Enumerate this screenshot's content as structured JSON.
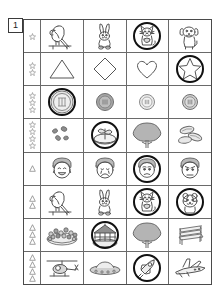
{
  "page": {
    "number_label": "1",
    "marker_star": "star",
    "marker_triangle": "triangle",
    "ring_color": "#111111",
    "grid_line_color": "#6a6a6a",
    "border_color": "#4a4a4a"
  },
  "rows": [
    {
      "marker_shape": "star",
      "marker_count": 1,
      "cells": [
        {
          "icon": "parrot-icon",
          "label": "parrot",
          "circled": false
        },
        {
          "icon": "rabbit-icon",
          "label": "rabbit",
          "circled": false
        },
        {
          "icon": "cat-icon",
          "label": "cat",
          "circled": true
        },
        {
          "icon": "dog-icon",
          "label": "dog",
          "circled": false
        }
      ]
    },
    {
      "marker_shape": "star",
      "marker_count": 2,
      "cells": [
        {
          "icon": "triangle-icon",
          "label": "triangle",
          "circled": false
        },
        {
          "icon": "diamond-icon",
          "label": "diamond",
          "circled": false
        },
        {
          "icon": "heart-icon",
          "label": "heart",
          "circled": false
        },
        {
          "icon": "star-icon",
          "label": "star",
          "circled": true
        }
      ]
    },
    {
      "marker_shape": "star",
      "marker_count": 3,
      "cells": [
        {
          "icon": "coin-large-icon",
          "label": "large coin",
          "circled": true
        },
        {
          "icon": "coin-medium-icon",
          "label": "medium coin",
          "circled": false
        },
        {
          "icon": "coin-small-icon",
          "label": "small coin",
          "circled": false
        },
        {
          "icon": "coin-small-dark-icon",
          "label": "small dark coin",
          "circled": false
        }
      ]
    },
    {
      "marker_shape": "star",
      "marker_count": 4,
      "cells": [
        {
          "icon": "seeds-icon",
          "label": "seeds",
          "circled": false
        },
        {
          "icon": "sprout-icon",
          "label": "sprout",
          "circled": true
        },
        {
          "icon": "tree-icon",
          "label": "tree",
          "circled": false
        },
        {
          "icon": "beans-icon",
          "label": "beans",
          "circled": false
        }
      ]
    },
    {
      "marker_shape": "triangle",
      "marker_count": 1,
      "cells": [
        {
          "icon": "face-happy-icon",
          "label": "happy face",
          "circled": false
        },
        {
          "icon": "face-sad-icon",
          "label": "sad face",
          "circled": false
        },
        {
          "icon": "face-worried-icon",
          "label": "worried face",
          "circled": true
        },
        {
          "icon": "face-angry-icon",
          "label": "angry face",
          "circled": false
        }
      ]
    },
    {
      "marker_shape": "triangle",
      "marker_count": 2,
      "cells": [
        {
          "icon": "parrot-icon",
          "label": "parrot",
          "circled": false
        },
        {
          "icon": "rabbit-icon",
          "label": "rabbit",
          "circled": false
        },
        {
          "icon": "cat-icon",
          "label": "cat",
          "circled": true
        },
        {
          "icon": "hamster-icon",
          "label": "hamster",
          "circled": true
        }
      ]
    },
    {
      "marker_shape": "triangle",
      "marker_count": 3,
      "cells": [
        {
          "icon": "flowerbed-icon",
          "label": "flower bed",
          "circled": false
        },
        {
          "icon": "gazebo-icon",
          "label": "gazebo",
          "circled": true
        },
        {
          "icon": "tree-icon",
          "label": "tree",
          "circled": false
        },
        {
          "icon": "bench-icon",
          "label": "bench",
          "circled": false
        }
      ]
    },
    {
      "marker_shape": "triangle",
      "marker_count": 4,
      "cells": [
        {
          "icon": "helicopter-icon",
          "label": "helicopter",
          "circled": false
        },
        {
          "icon": "ufo-icon",
          "label": "flying saucer",
          "circled": false
        },
        {
          "icon": "rocket-icon",
          "label": "rocket",
          "circled": true
        },
        {
          "icon": "airplane-icon",
          "label": "airplane",
          "circled": false
        }
      ]
    }
  ]
}
